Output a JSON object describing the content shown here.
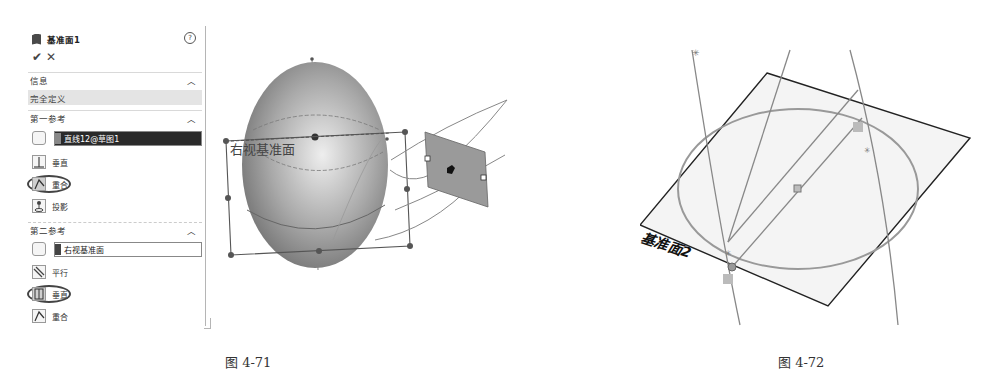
{
  "panel": {
    "title": "基准面1",
    "help_icon": "?",
    "ok_icon": "✔",
    "cancel_icon": "✕",
    "info_section": {
      "label": "信息",
      "status": "完全定义"
    },
    "first_reference": {
      "label": "第一参考",
      "selection": "直线12@草图1",
      "options": [
        {
          "label": "垂直",
          "icon": "perpendicular-icon",
          "selected": false
        },
        {
          "label": "重合",
          "icon": "coincident-icon",
          "selected": true
        },
        {
          "label": "投影",
          "icon": "project-icon",
          "selected": false
        }
      ]
    },
    "second_reference": {
      "label": "第二参考",
      "selection": "右视基准面",
      "options": [
        {
          "label": "平行",
          "icon": "parallel-icon",
          "selected": false
        },
        {
          "label": "垂直",
          "icon": "perpendicular-icon",
          "selected": true
        },
        {
          "label": "重合",
          "icon": "coincident-icon",
          "selected": false
        }
      ]
    }
  },
  "figure_71": {
    "plane_label": "右视基准面",
    "caption": "图 4-71"
  },
  "figure_72": {
    "plane_label": "基准面2",
    "caption": "图 4-72"
  },
  "colors": {
    "selection_dark": "#2a2a2a",
    "plane_fill": "#9a9a9a",
    "sketch_line": "#8a8a8a"
  }
}
